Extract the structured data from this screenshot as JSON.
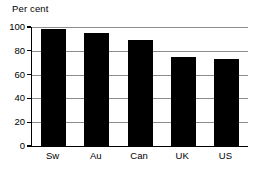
{
  "chart_data": {
    "type": "bar",
    "title": "Per cent",
    "xlabel": "",
    "ylabel": "Per cent",
    "categories": [
      "Sw",
      "Au",
      "Can",
      "UK",
      "US"
    ],
    "values": [
      98,
      95,
      89,
      75,
      73
    ],
    "ylim": [
      0,
      100
    ],
    "yticks": [
      0,
      20,
      40,
      60,
      80,
      100
    ],
    "ytick_labels": [
      "0",
      "20",
      "40",
      "60",
      "80",
      "100"
    ],
    "grid": true,
    "grid_axis": "y",
    "legend": false,
    "bar_color": "#000000",
    "grid_color": "#8c8c8c",
    "axis_color": "#000000",
    "background": "#ffffff"
  }
}
